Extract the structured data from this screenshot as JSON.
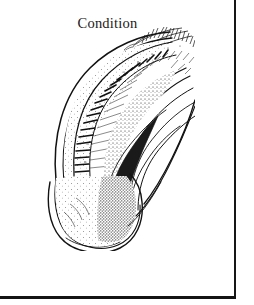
{
  "page": {
    "background_color": "#ffffff",
    "ink_color": "#121212",
    "width": 254,
    "height": 305
  },
  "figure": {
    "title": "Condition",
    "caption": "",
    "medium": "black-and-white engraved line illustration with stipple shading",
    "orientation": "curving from lower-left base upward and to the right"
  },
  "borders": {
    "right_rule_label": "page-rule-right",
    "bottom_rule_label": "page-rule-bottom",
    "color": "#171717"
  }
}
